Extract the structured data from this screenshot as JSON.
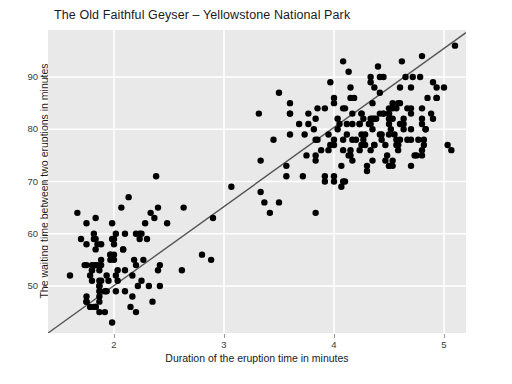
{
  "chart_data": {
    "type": "scatter",
    "title": "The Old Faithful Geyser – Yellowstone National Park",
    "xlabel": "Duration of the eruption time in minutes",
    "ylabel": "The waiting time between two eruptions in minutes",
    "xticks": [
      2,
      3,
      4,
      5
    ],
    "yticks": [
      50,
      60,
      70,
      80,
      90
    ],
    "xlim": [
      1.4,
      5.2
    ],
    "ylim": [
      41,
      99
    ],
    "grid": true,
    "legend": "none",
    "plot_background": "#e9e9e9",
    "gridline_color": "#ffffff",
    "point_color": "#000000",
    "point_size": 4,
    "trendline": {
      "type": "linear",
      "color": "#555555",
      "x_start": 1.4,
      "y_start": 41.0,
      "x_end": 5.2,
      "y_end": 98.5
    },
    "series": [
      {
        "name": "eruptions",
        "x": [
          3.6,
          1.8,
          3.333,
          2.283,
          4.533,
          2.883,
          4.7,
          3.6,
          1.95,
          4.35,
          1.833,
          3.917,
          4.2,
          1.75,
          4.7,
          2.167,
          1.75,
          4.8,
          1.6,
          4.25,
          1.8,
          1.75,
          3.45,
          3.067,
          4.533,
          3.6,
          1.967,
          4.083,
          3.85,
          4.433,
          4.3,
          4.467,
          3.367,
          4.033,
          3.833,
          2.017,
          1.867,
          4.833,
          1.833,
          4.783,
          4.35,
          1.883,
          4.567,
          1.75,
          4.533,
          3.317,
          3.833,
          2.1,
          4.633,
          2.0,
          4.8,
          4.716,
          1.833,
          4.833,
          1.733,
          4.883,
          3.717,
          1.667,
          4.567,
          4.317,
          2.233,
          4.5,
          1.75,
          4.8,
          1.817,
          4.4,
          4.167,
          4.7,
          2.067,
          4.7,
          4.033,
          1.967,
          4.5,
          4.0,
          1.983,
          5.067,
          2.017,
          4.567,
          3.883,
          3.6,
          4.133,
          4.333,
          4.1,
          2.633,
          4.067,
          4.933,
          3.95,
          4.517,
          2.167,
          4.0,
          2.2,
          4.333,
          1.867,
          4.817,
          1.833,
          4.3,
          4.667,
          3.75,
          1.867,
          4.9,
          2.483,
          4.367,
          2.1,
          4.5,
          4.05,
          1.867,
          4.7,
          1.783,
          4.85,
          3.683,
          4.733,
          2.3,
          4.9,
          4.417,
          1.7,
          4.633,
          2.317,
          4.6,
          1.817,
          4.417,
          2.617,
          4.067,
          4.25,
          1.967,
          4.6,
          3.767,
          1.917,
          4.5,
          2.267,
          4.65,
          1.867,
          4.167,
          2.8,
          4.333,
          1.833,
          4.383,
          1.883,
          4.933,
          2.033,
          3.733,
          4.233,
          2.233,
          4.533,
          4.817,
          4.333,
          1.983,
          4.633,
          2.017,
          5.1,
          1.8,
          5.033,
          4.0,
          2.4,
          4.6,
          3.567,
          4.0,
          4.5,
          4.083,
          1.8,
          3.967,
          2.2,
          4.15,
          2.0,
          3.833,
          3.5,
          4.583,
          2.367,
          5.0,
          1.933,
          4.617,
          1.917,
          2.083,
          4.583,
          3.333,
          4.167,
          4.333,
          4.5,
          2.417,
          4.0,
          4.167,
          1.883,
          4.583,
          4.25,
          3.767,
          2.033,
          4.433,
          4.083,
          1.833,
          4.417,
          2.183,
          4.8,
          1.833,
          4.8,
          4.1,
          3.966,
          4.233,
          3.5,
          4.366,
          2.25,
          4.667,
          2.1,
          4.35,
          4.133,
          1.867,
          4.6,
          1.783,
          4.367,
          3.85,
          1.933,
          4.5,
          2.383,
          4.7,
          1.867,
          3.833,
          3.417,
          4.233,
          2.4,
          4.8,
          2.0,
          4.15,
          1.867,
          4.267,
          1.75,
          4.483,
          4.0,
          4.117,
          4.083,
          4.267,
          3.917,
          4.55,
          4.083,
          2.417,
          4.183,
          2.217,
          4.45,
          1.883,
          1.85,
          4.283,
          3.95,
          2.333,
          4.15,
          2.35,
          4.933,
          2.9,
          4.583,
          3.833,
          2.083,
          4.367,
          2.133,
          4.35,
          2.2,
          4.45,
          3.567,
          4.5,
          4.15,
          3.817,
          3.917,
          4.45,
          2.0,
          4.283,
          4.767,
          4.533,
          1.85,
          4.25,
          1.983,
          2.25,
          4.75,
          4.117,
          2.15,
          4.417,
          1.817,
          4.467
        ],
        "y": [
          79,
          54,
          74,
          62,
          85,
          55,
          88,
          85,
          51,
          85,
          54,
          84,
          78,
          47,
          83,
          52,
          62,
          84,
          52,
          79,
          51,
          47,
          78,
          69,
          74,
          83,
          55,
          76,
          78,
          79,
          73,
          77,
          66,
          80,
          74,
          52,
          48,
          80,
          59,
          90,
          80,
          58,
          84,
          58,
          73,
          83,
          64,
          53,
          82,
          59,
          75,
          90,
          54,
          80,
          54,
          83,
          71,
          64,
          77,
          81,
          59,
          84,
          48,
          82,
          60,
          92,
          78,
          78,
          65,
          73,
          82,
          56,
          79,
          71,
          62,
          76,
          60,
          78,
          76,
          83,
          75,
          82,
          70,
          65,
          73,
          88,
          76,
          80,
          48,
          86,
          60,
          90,
          50,
          78,
          63,
          72,
          84,
          75,
          51,
          82,
          62,
          88,
          49,
          83,
          81,
          47,
          84,
          52,
          86,
          81,
          75,
          59,
          89,
          79,
          59,
          81,
          50,
          85,
          59,
          87,
          53,
          69,
          77,
          56,
          88,
          81,
          45,
          82,
          55,
          90,
          45,
          83,
          56,
          89,
          46,
          82,
          51,
          86,
          53,
          79,
          81,
          60,
          82,
          77,
          76,
          59,
          80,
          49,
          96,
          53,
          77,
          77,
          65,
          81,
          71,
          70,
          81,
          93,
          53,
          89,
          45,
          86,
          58,
          78,
          66,
          76,
          63,
          88,
          52,
          93,
          49,
          57,
          77,
          68,
          81,
          81,
          73,
          50,
          85,
          74,
          55,
          77,
          83,
          83,
          51,
          78,
          84,
          46,
          83,
          55,
          81,
          57,
          76,
          84,
          77,
          81,
          87,
          77,
          51,
          78,
          60,
          82,
          91,
          53,
          78,
          46,
          77,
          84,
          49,
          83,
          71,
          80,
          49,
          75,
          64,
          76,
          53,
          94,
          55,
          76,
          50,
          82,
          54,
          75,
          78,
          79,
          78,
          78,
          70,
          79,
          70,
          54,
          86,
          50,
          90,
          54,
          54,
          77,
          79,
          64,
          75,
          47,
          86,
          63,
          85,
          82,
          57,
          82,
          67,
          74,
          54,
          83,
          73,
          73,
          88,
          80,
          71,
          83,
          56,
          79,
          78,
          84,
          58,
          83,
          43,
          60,
          75,
          81,
          46,
          90,
          46,
          74
        ]
      }
    ]
  }
}
